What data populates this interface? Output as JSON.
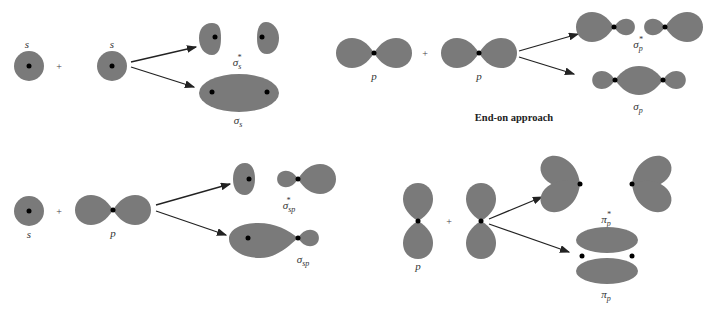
{
  "panels": {
    "s_s": {
      "left_label": "s",
      "right_label": "s",
      "plus": "+",
      "antibonding": {
        "symbol": "σ",
        "sub": "s",
        "sup": "*"
      },
      "bonding": {
        "symbol": "σ",
        "sub": "s"
      }
    },
    "p_p_end_on": {
      "left_label": "p",
      "right_label": "p",
      "plus": "+",
      "antibonding": {
        "symbol": "σ",
        "sub": "p",
        "sup": "*"
      },
      "bonding": {
        "symbol": "σ",
        "sub": "p"
      },
      "caption": "End-on approach"
    },
    "s_p": {
      "left_label": "s",
      "right_label": "p",
      "plus": "+",
      "antibonding": {
        "symbol": "σ",
        "sub": "sp",
        "sup": "*"
      },
      "bonding": {
        "symbol": "σ",
        "sub": "sp"
      }
    },
    "p_p_side": {
      "left_label": "p",
      "plus": "+",
      "antibonding": {
        "symbol": "π",
        "sub": "p",
        "sup": "*"
      },
      "bonding": {
        "symbol": "π",
        "sub": "p"
      }
    }
  },
  "colors": {
    "orbital": "#7a7a7a",
    "nucleus": "#000000",
    "arrow": "#222222"
  }
}
